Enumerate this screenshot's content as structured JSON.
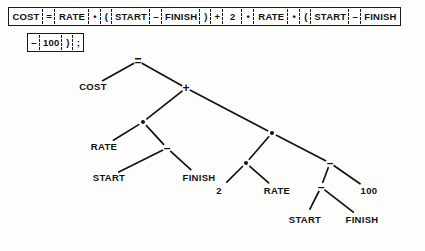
{
  "figure": {
    "ink_color": "#121212",
    "background_color": "#ffffff"
  },
  "token_strip": {
    "row1": [
      {
        "text": "COST",
        "kind": "identifier"
      },
      {
        "text": "=",
        "kind": "operator"
      },
      {
        "text": "RATE",
        "kind": "identifier"
      },
      {
        "text": "•",
        "kind": "operator"
      },
      {
        "text": "(",
        "kind": "paren"
      },
      {
        "text": "START",
        "kind": "identifier"
      },
      {
        "text": "–",
        "kind": "operator"
      },
      {
        "text": "FINISH",
        "kind": "identifier"
      },
      {
        "text": ")",
        "kind": "paren"
      },
      {
        "text": "+",
        "kind": "operator"
      },
      {
        "text": "2",
        "kind": "number"
      },
      {
        "text": "•",
        "kind": "operator"
      },
      {
        "text": "RATE",
        "kind": "identifier"
      },
      {
        "text": "•",
        "kind": "operator"
      },
      {
        "text": "(",
        "kind": "paren"
      },
      {
        "text": "START",
        "kind": "identifier"
      },
      {
        "text": "–",
        "kind": "operator"
      },
      {
        "text": "FINISH",
        "kind": "identifier"
      }
    ],
    "row2": [
      {
        "text": "–",
        "kind": "operator"
      },
      {
        "text": "100",
        "kind": "number"
      },
      {
        "text": ")",
        "kind": "paren"
      },
      {
        "text": ";",
        "kind": "terminator"
      }
    ]
  },
  "tree": {
    "nodes": [
      {
        "id": "n1",
        "label": "=",
        "type": "op",
        "x": 138,
        "y": 61
      },
      {
        "id": "n2",
        "label": "COST",
        "type": "leaf",
        "x": 93,
        "y": 86
      },
      {
        "id": "n3",
        "label": "+",
        "type": "op",
        "x": 186,
        "y": 88
      },
      {
        "id": "n4",
        "label": "•",
        "type": "dot",
        "x": 143,
        "y": 122
      },
      {
        "id": "n5",
        "label": "RATE",
        "type": "leaf",
        "x": 104,
        "y": 146
      },
      {
        "id": "n6",
        "label": "–",
        "type": "op",
        "x": 167,
        "y": 148
      },
      {
        "id": "n7",
        "label": "START",
        "type": "leaf",
        "x": 109,
        "y": 177
      },
      {
        "id": "n8",
        "label": "FINISH",
        "type": "leaf",
        "x": 199,
        "y": 177
      },
      {
        "id": "n9",
        "label": "•",
        "type": "dot",
        "x": 272,
        "y": 133
      },
      {
        "id": "n10",
        "label": "•",
        "type": "dot",
        "x": 246,
        "y": 163
      },
      {
        "id": "n11",
        "label": "–",
        "type": "op",
        "x": 330,
        "y": 163
      },
      {
        "id": "n12",
        "label": "2",
        "type": "leaf",
        "x": 219,
        "y": 190
      },
      {
        "id": "n13",
        "label": "RATE",
        "type": "leaf",
        "x": 277,
        "y": 190
      },
      {
        "id": "n14",
        "label": "–",
        "type": "op",
        "x": 321,
        "y": 187
      },
      {
        "id": "n15",
        "label": "100",
        "type": "leaf",
        "x": 369,
        "y": 190
      },
      {
        "id": "n16",
        "label": "START",
        "type": "leaf",
        "x": 305,
        "y": 219
      },
      {
        "id": "n17",
        "label": "FINISH",
        "type": "leaf",
        "x": 362,
        "y": 219
      }
    ],
    "edges": [
      {
        "from": "n1",
        "to": "n2"
      },
      {
        "from": "n1",
        "to": "n3"
      },
      {
        "from": "n3",
        "to": "n4"
      },
      {
        "from": "n3",
        "to": "n9"
      },
      {
        "from": "n4",
        "to": "n5"
      },
      {
        "from": "n4",
        "to": "n6"
      },
      {
        "from": "n6",
        "to": "n7"
      },
      {
        "from": "n6",
        "to": "n8"
      },
      {
        "from": "n9",
        "to": "n10"
      },
      {
        "from": "n9",
        "to": "n11"
      },
      {
        "from": "n10",
        "to": "n12"
      },
      {
        "from": "n10",
        "to": "n13"
      },
      {
        "from": "n11",
        "to": "n14"
      },
      {
        "from": "n11",
        "to": "n15"
      },
      {
        "from": "n14",
        "to": "n16"
      },
      {
        "from": "n14",
        "to": "n17"
      }
    ]
  }
}
